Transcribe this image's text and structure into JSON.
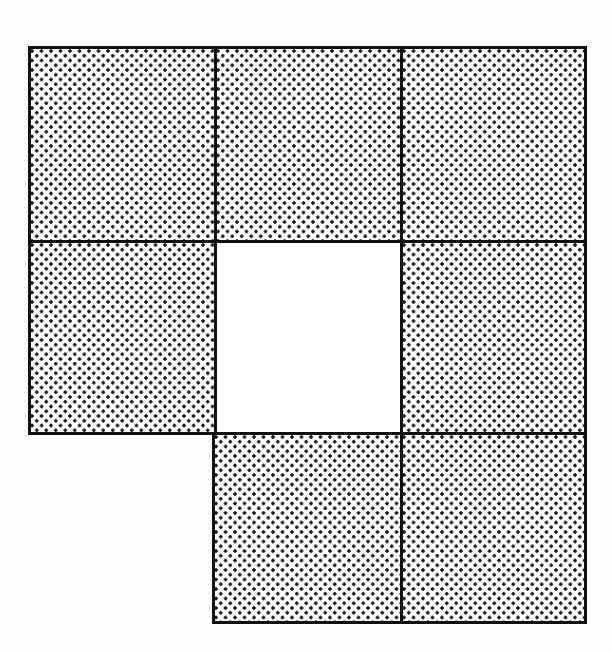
{
  "figure": {
    "type": "grid-of-squares",
    "rows": 3,
    "cols": 3,
    "fill_pattern": "stipple-dots",
    "colors": {
      "line": "#111111",
      "dot": "#1a1a1a",
      "background": "#ffffff"
    },
    "cells": [
      {
        "row": 0,
        "col": 0,
        "state": "stippled"
      },
      {
        "row": 0,
        "col": 1,
        "state": "stippled"
      },
      {
        "row": 0,
        "col": 2,
        "state": "stippled"
      },
      {
        "row": 1,
        "col": 0,
        "state": "stippled"
      },
      {
        "row": 1,
        "col": 1,
        "state": "empty"
      },
      {
        "row": 1,
        "col": 2,
        "state": "stippled"
      },
      {
        "row": 2,
        "col": 0,
        "state": "missing"
      },
      {
        "row": 2,
        "col": 1,
        "state": "stippled"
      },
      {
        "row": 2,
        "col": 2,
        "state": "stippled"
      }
    ],
    "counts": {
      "stippled": 7,
      "empty": 1,
      "missing": 1
    }
  }
}
